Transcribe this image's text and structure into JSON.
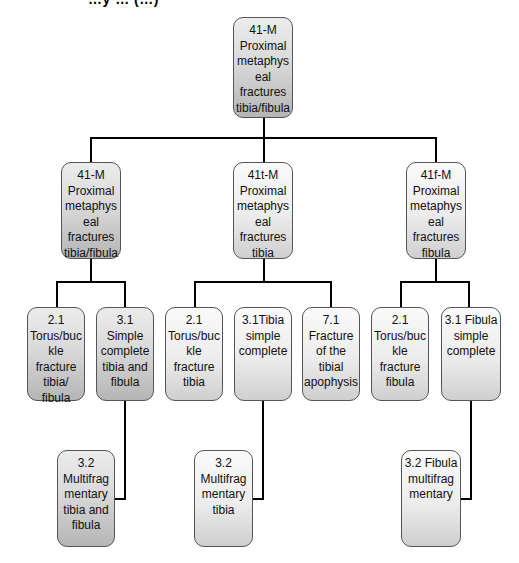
{
  "header": {
    "cut_title": "…y … (…)"
  },
  "tree": {
    "root": {
      "lines": [
        "41-M",
        "Proximal",
        "metaphys",
        "eal",
        "fractures",
        "tibia/fibula"
      ]
    },
    "level1": [
      {
        "lines": [
          "41-M",
          "Proximal",
          "metaphys",
          "eal",
          "fractures",
          "tibia/fibula"
        ]
      },
      {
        "lines": [
          "41t-M",
          "Proximal",
          "metaphys",
          "eal",
          "fractures",
          "tibia"
        ]
      },
      {
        "lines": [
          "41f-M",
          "Proximal",
          "metaphys",
          "eal",
          "fractures",
          "fibula"
        ]
      }
    ],
    "level2": [
      {
        "lines": [
          "2.1",
          "Torus/buc",
          "kle",
          "fracture",
          "tibia/",
          "fibula"
        ]
      },
      {
        "lines": [
          "3.1",
          "Simple",
          "complete",
          "tibia and",
          "fibula"
        ]
      },
      {
        "lines": [
          "2.1",
          "Torus/buc",
          "kle",
          "fracture",
          "tibia"
        ]
      },
      {
        "lines": [
          "3.1Tibia",
          "simple",
          "complete"
        ]
      },
      {
        "lines": [
          "7.1",
          "Fracture",
          "of the",
          "tibial",
          "apophysis"
        ]
      },
      {
        "lines": [
          "2.1",
          "Torus/buc",
          "kle",
          "fracture",
          "fibula"
        ]
      },
      {
        "lines": [
          "3.1 Fibula",
          "simple",
          "complete"
        ]
      }
    ],
    "level3": [
      {
        "lines": [
          "3.2",
          "Multifrag",
          "mentary",
          "tibia and",
          "fibula"
        ]
      },
      {
        "lines": [
          "3.2",
          "Multifrag",
          "mentary",
          "tibia"
        ]
      },
      {
        "lines": [
          "3.2 Fibula",
          "multifrag",
          "mentary"
        ]
      }
    ]
  },
  "colors": {
    "dark_box_bottom": "#b5b5b5",
    "light_box_bottom": "#cfcfcf",
    "connector": "#000000",
    "border": "#555555"
  }
}
